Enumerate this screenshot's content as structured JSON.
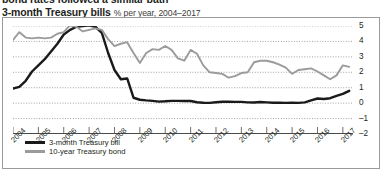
{
  "clipped_top_text": "bond rates followed a similar path",
  "header": {
    "title": "3-month Treasury bills",
    "subtitle": "% per year, 2004–2017"
  },
  "legend": {
    "position": "inside-bottom-left",
    "entries": [
      {
        "label": "3-month Treasury bill",
        "color": "#1a1a1a",
        "swatch": "black"
      },
      {
        "label": "10-year Treasury bond",
        "color": "#9b9b9b",
        "swatch": "gray"
      }
    ]
  },
  "colors": {
    "tbill": "#1a1a1a",
    "tbond": "#9b9b9b",
    "gridline": "#8d8d8d",
    "frame": "#9a9a9a",
    "axis": "#4a4a4a",
    "text": "#231f20"
  },
  "chart_data": {
    "type": "line",
    "title": "3-month Treasury bills",
    "subtitle": "% per year, 2004–2017",
    "xlabel": "",
    "ylabel": "",
    "ylim": [
      -2,
      5
    ],
    "yticks": [
      5,
      4,
      3,
      2,
      1,
      0,
      -1,
      -2
    ],
    "grid": true,
    "grid_style": "dotted-horizontal",
    "xlim": [
      2004,
      2017.4
    ],
    "xticks": [
      2004,
      2005,
      2006,
      2007,
      2008,
      2009,
      2010,
      2011,
      2012,
      2013,
      2014,
      2015,
      2016,
      2017
    ],
    "xtick_labels": [
      "2004",
      "2005",
      "2006",
      "2007",
      "2008",
      "2009",
      "2010",
      "2011",
      "2012",
      "2013",
      "2014",
      "2015",
      "2016",
      "2017"
    ],
    "x": [
      2004.0,
      2004.25,
      2004.5,
      2004.75,
      2005.0,
      2005.25,
      2005.5,
      2005.75,
      2006.0,
      2006.25,
      2006.5,
      2006.75,
      2007.0,
      2007.25,
      2007.5,
      2007.75,
      2008.0,
      2008.25,
      2008.5,
      2008.75,
      2009.0,
      2009.25,
      2009.5,
      2009.75,
      2010.0,
      2010.25,
      2010.5,
      2010.75,
      2011.0,
      2011.25,
      2011.5,
      2011.75,
      2012.0,
      2012.25,
      2012.5,
      2012.75,
      2013.0,
      2013.25,
      2013.5,
      2013.75,
      2014.0,
      2014.25,
      2014.5,
      2014.75,
      2015.0,
      2015.25,
      2015.5,
      2015.75,
      2016.0,
      2016.25,
      2016.5,
      2016.75,
      2017.0,
      2017.25
    ],
    "series": [
      {
        "name": "3-month Treasury bill",
        "color": "#1a1a1a",
        "values": [
          0.95,
          1.05,
          1.45,
          2.05,
          2.45,
          2.85,
          3.35,
          3.85,
          4.45,
          4.75,
          4.95,
          5.0,
          5.05,
          4.95,
          4.55,
          3.25,
          2.15,
          1.55,
          1.6,
          0.35,
          0.22,
          0.18,
          0.15,
          0.1,
          0.12,
          0.15,
          0.15,
          0.14,
          0.14,
          0.06,
          0.03,
          0.02,
          0.06,
          0.09,
          0.1,
          0.08,
          0.08,
          0.05,
          0.04,
          0.07,
          0.05,
          0.03,
          0.03,
          0.02,
          0.03,
          0.02,
          0.05,
          0.18,
          0.3,
          0.27,
          0.32,
          0.47,
          0.6,
          0.8
        ]
      },
      {
        "name": "10-year Treasury bond",
        "color": "#9b9b9b",
        "values": [
          4.1,
          4.6,
          4.25,
          4.2,
          4.25,
          4.2,
          4.25,
          4.5,
          4.6,
          5.05,
          4.95,
          4.65,
          4.75,
          4.85,
          4.75,
          4.15,
          3.7,
          3.85,
          3.95,
          3.25,
          2.6,
          3.25,
          3.5,
          3.45,
          3.7,
          3.45,
          2.9,
          2.75,
          3.45,
          3.2,
          2.45,
          2.0,
          1.95,
          1.9,
          1.65,
          1.75,
          1.95,
          2.0,
          2.65,
          2.75,
          2.75,
          2.65,
          2.5,
          2.3,
          1.9,
          2.15,
          2.2,
          2.25,
          2.05,
          1.8,
          1.55,
          1.8,
          2.45,
          2.35
        ]
      }
    ]
  }
}
